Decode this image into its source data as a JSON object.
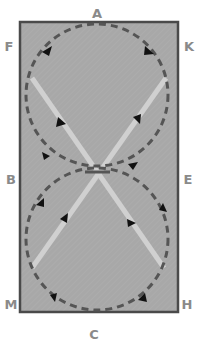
{
  "diagram": {
    "arena_letters": {
      "top": "A",
      "top_left": "F",
      "top_right": "K",
      "mid_left": "B",
      "mid_right": "E",
      "bottom_left": "M",
      "bottom_right": "H",
      "bottom": "C"
    },
    "colors": {
      "arena_fill": "#a8a8a8",
      "arena_border": "#4a4a4a",
      "dashed_path": "#555555",
      "diagonal_line": "#d0d0d0",
      "arrow": "#111111",
      "letter": "#8a8a8a"
    },
    "elements": {
      "circles": [
        {
          "name": "upper-circle",
          "style": "dashed"
        },
        {
          "name": "lower-circle",
          "style": "dashed"
        }
      ],
      "diagonals": [
        {
          "name": "diagonal-left-to-right",
          "style": "solid-light"
        },
        {
          "name": "diagonal-right-to-left",
          "style": "solid-light"
        }
      ],
      "arrow_count": 12
    }
  }
}
